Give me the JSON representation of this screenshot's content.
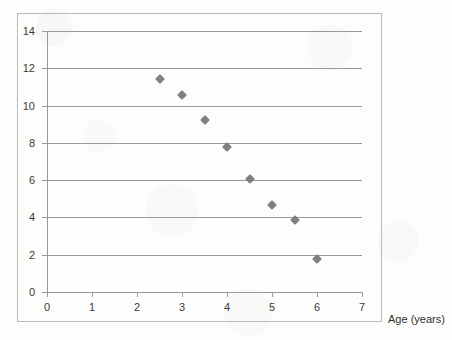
{
  "chart_data": {
    "type": "scatter",
    "title": "",
    "xlabel": "Age (years)",
    "ylabel": "",
    "xlim": [
      0,
      7
    ],
    "ylim": [
      0,
      14
    ],
    "x_ticks": [
      0,
      1,
      2,
      3,
      4,
      5,
      6,
      7
    ],
    "y_ticks": [
      0,
      2,
      4,
      6,
      8,
      10,
      12,
      14
    ],
    "grid": "horizontal",
    "legend": "none",
    "marker": "diamond",
    "marker_color": "#808080",
    "points": [
      {
        "x": 2.5,
        "y": 11.45
      },
      {
        "x": 3.0,
        "y": 10.55
      },
      {
        "x": 3.5,
        "y": 9.2
      },
      {
        "x": 4.0,
        "y": 7.8
      },
      {
        "x": 4.5,
        "y": 6.05
      },
      {
        "x": 5.0,
        "y": 4.65
      },
      {
        "x": 5.5,
        "y": 3.85
      },
      {
        "x": 6.0,
        "y": 1.75
      }
    ]
  },
  "axis_titles": {
    "x": "Age (years)"
  },
  "colors": {
    "marker": "#808080",
    "gridline": "#9a9a9a",
    "axis": "#9a9a9a",
    "frame": "#b9b9b9",
    "tick_label": "#3a3a3a",
    "background": "#fdfdfc"
  }
}
